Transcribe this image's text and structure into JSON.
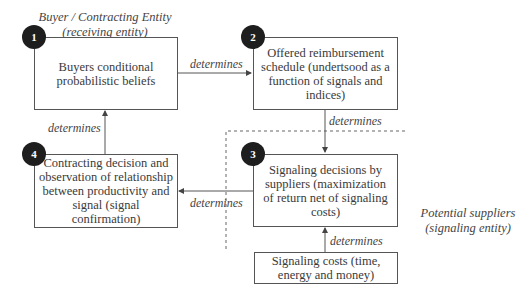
{
  "entities": {
    "buyer": {
      "line1": "Buyer / Contracting Entity",
      "line2": "(receiving entity)"
    },
    "supplier": {
      "line1": "Potential suppliers",
      "line2": "(signaling entity)"
    }
  },
  "nodes": [
    {
      "number": "1",
      "text": "Buyers conditional probabilistic beliefs"
    },
    {
      "number": "2",
      "text": "Offered reimbursement schedule (undertsood as a function of signals and indices)"
    },
    {
      "number": "3",
      "text": "Signaling decisions by suppliers (maximization of return net of signaling costs)"
    },
    {
      "number": "4",
      "text": "Contracting decision and observation of relationship between productivity and signal (signal confirmation)"
    }
  ],
  "cost_node": {
    "text": "Signaling costs (time, energy and money)"
  },
  "edges": [
    {
      "from": "1",
      "to": "2",
      "label": "determines"
    },
    {
      "from": "2",
      "to": "3",
      "label": "determines"
    },
    {
      "from": "3",
      "to": "4",
      "label": "determines"
    },
    {
      "from": "4",
      "to": "1",
      "label": "determines"
    },
    {
      "from": "costs",
      "to": "3",
      "label": "determines"
    }
  ],
  "colors": {
    "badge": "#1e1e1e",
    "line": "#555555",
    "dashed": "#666666"
  }
}
